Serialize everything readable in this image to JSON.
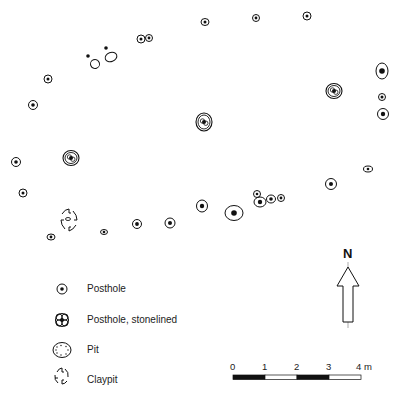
{
  "legend": {
    "items": [
      {
        "key": "posthole",
        "label": "Posthole"
      },
      {
        "key": "posthole_stonelined",
        "label": "Posthole, stonelined"
      },
      {
        "key": "pit",
        "label": "Pit"
      },
      {
        "key": "claypit",
        "label": "Claypit"
      }
    ]
  },
  "north_arrow": {
    "label": "N"
  },
  "scale_bar": {
    "ticks": [
      "0",
      "1",
      "2",
      "3",
      "4 m"
    ],
    "unit": "m",
    "max": 4
  },
  "colors": {
    "ink": "#111111",
    "background": "#ffffff"
  },
  "features": [
    {
      "type": "posthole",
      "id": "ph-n1"
    },
    {
      "type": "posthole",
      "id": "ph-n2"
    },
    {
      "type": "posthole",
      "id": "ph-n3"
    },
    {
      "type": "posthole",
      "id": "ph-n4"
    },
    {
      "type": "posthole",
      "id": "ph-n5"
    },
    {
      "type": "stakehole",
      "id": "sh-1"
    },
    {
      "type": "stakehole",
      "id": "sh-2"
    },
    {
      "type": "pit-empty",
      "id": "pe-1"
    },
    {
      "type": "pit-empty",
      "id": "pe-2"
    },
    {
      "type": "posthole",
      "id": "ph-w1"
    },
    {
      "type": "posthole",
      "id": "ph-w2"
    },
    {
      "type": "posthole",
      "id": "ph-e1"
    },
    {
      "type": "posthole",
      "id": "ph-e2"
    },
    {
      "type": "posthole",
      "id": "ph-e3"
    },
    {
      "type": "posthole_stonelined",
      "id": "st-e"
    },
    {
      "type": "posthole_stonelined",
      "id": "st-c"
    },
    {
      "type": "posthole_stonelined",
      "id": "st-w"
    },
    {
      "type": "posthole",
      "id": "ph-w3"
    },
    {
      "type": "posthole",
      "id": "ph-w4"
    },
    {
      "type": "claypit",
      "id": "cp-1"
    },
    {
      "type": "posthole",
      "id": "ph-s1"
    },
    {
      "type": "posthole",
      "id": "ph-s2"
    },
    {
      "type": "posthole",
      "id": "ph-s3"
    },
    {
      "type": "posthole",
      "id": "ph-s4"
    },
    {
      "type": "posthole",
      "id": "ph-s5"
    },
    {
      "type": "posthole",
      "id": "ph-s6"
    },
    {
      "type": "posthole",
      "id": "ph-s7"
    },
    {
      "type": "posthole",
      "id": "ph-s8"
    },
    {
      "type": "posthole",
      "id": "ph-s9"
    },
    {
      "type": "posthole",
      "id": "ph-s10"
    },
    {
      "type": "posthole",
      "id": "ph-s11"
    },
    {
      "type": "posthole",
      "id": "ph-s12"
    }
  ]
}
